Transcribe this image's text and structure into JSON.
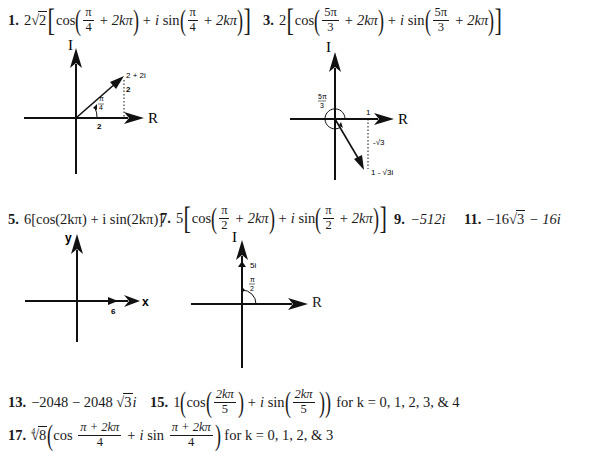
{
  "problems": {
    "p1": {
      "number": "1.",
      "coef": "2",
      "root": "2",
      "cos": "cos",
      "sin": "sin",
      "i": "i",
      "plus": "+",
      "frac_num": "π",
      "frac_den": "4",
      "term": "2kπ"
    },
    "p3": {
      "number": "3.",
      "coef": "2",
      "cos": "cos",
      "sin": "sin",
      "i": "i",
      "plus": "+",
      "frac_num": "5π",
      "frac_den": "3",
      "term": "2kπ"
    },
    "p5": {
      "number": "5.",
      "text": "6[cos(2kπ) + i sin(2kπ)]"
    },
    "p7": {
      "number": "7.",
      "coef": "5",
      "cos": "cos",
      "sin": "sin",
      "i": "i",
      "plus": "+",
      "frac_num": "π",
      "frac_den": "2",
      "term": "2kπ"
    },
    "p9": {
      "number": "9.",
      "text": "−512i"
    },
    "p11": {
      "number": "11.",
      "pre": "−16",
      "root": "3",
      "post": "− 16i"
    },
    "p13": {
      "number": "13.",
      "pre": "−2048 − 2048",
      "root": "3",
      "post": "i"
    },
    "p15": {
      "number": "15.",
      "coef": "1",
      "cos": "cos",
      "sin": "sin",
      "i": "i",
      "plus": "+",
      "frac_num": "2kπ",
      "frac_den": "5",
      "suffix": "for k = 0, 1, 2, 3, & 4"
    },
    "p17": {
      "number": "17.",
      "root_index": "4",
      "root": "8",
      "cos": "cos",
      "sin": "sin",
      "i": "i",
      "plus": "+",
      "frac_num": "π + 2kπ",
      "frac_den": "4",
      "suffix": "for k = 0, 1, 2, & 3"
    }
  },
  "diagrams": {
    "d1": {
      "y_axis": "I",
      "x_axis": "R",
      "point_label": "2 + 2i",
      "x_val": "2",
      "y_val": "2",
      "angle_num": "π",
      "angle_den": "4"
    },
    "d3": {
      "y_axis": "I",
      "x_axis": "R",
      "point_label": "1 - √3i",
      "x_val": "1",
      "y_val": "-√3",
      "angle_num": "5π",
      "angle_den": "3"
    },
    "d5": {
      "y_axis": "y",
      "x_axis": "x",
      "x_val": "6"
    },
    "d7": {
      "y_axis": "I",
      "x_axis": "R",
      "y_val": "5i",
      "angle_num": "π",
      "angle_den": "2"
    }
  }
}
